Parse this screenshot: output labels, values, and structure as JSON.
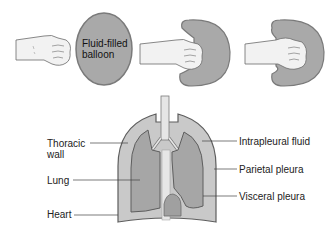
{
  "top_row": {
    "balloon_label_line1": "Fluid-filled",
    "balloon_label_line2": "balloon",
    "panels": [
      {
        "name": "fist-alone"
      },
      {
        "name": "fluid-filled-balloon"
      },
      {
        "name": "fist-pressing-balloon"
      },
      {
        "name": "fist-enveloped-by-balloon"
      }
    ]
  },
  "lung_diagram": {
    "labels_left": {
      "thoracic_wall_line1": "Thoracic",
      "thoracic_wall_line2": "wall",
      "lung": "Lung",
      "heart": "Heart"
    },
    "labels_right": {
      "intrapleural_fluid": "Intrapleural fluid",
      "parietal_pleura": "Parietal pleura",
      "visceral_pleura": "Visceral pleura"
    }
  },
  "colors": {
    "balloon_fill": "#a9a9a9",
    "balloon_outline": "#7a7a7a",
    "pleural_fluid_fill": "#c9c9c9",
    "lung_fill": "#a6a6a6",
    "outline": "#5e5e5e",
    "skin_fill": "#f2f2f2"
  }
}
